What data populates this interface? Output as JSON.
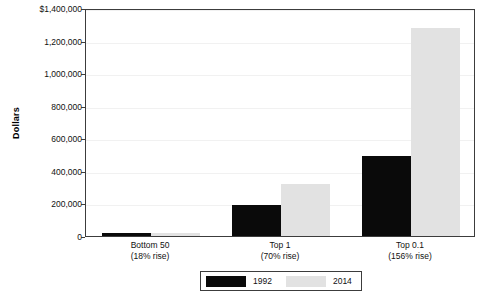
{
  "chart_data": {
    "type": "bar",
    "title": "",
    "subtitle": "",
    "xlabel": "",
    "ylabel": "Dollars",
    "categories": [
      "Bottom 50",
      "Top 1",
      "Top 0.1"
    ],
    "category_sublabels": [
      "(18% rise)",
      "(70% rise)",
      "(156% rise)"
    ],
    "series": [
      {
        "name": "1992",
        "color": "#0a0a0a",
        "values": [
          17000,
          190000,
          490000
        ]
      },
      {
        "name": "2014",
        "color": "#e2e2e2",
        "values": [
          20000,
          320000,
          1275000
        ]
      }
    ],
    "ylim": [
      0,
      1400000
    ],
    "yticks": [
      0,
      200000,
      400000,
      600000,
      800000,
      1000000,
      1200000,
      1400000
    ],
    "ytick_labels": [
      "0",
      "200,000",
      "400,000",
      "600,000",
      "800,000",
      "1,000,000",
      "1,200,000",
      "$1,400,000"
    ],
    "grid": true,
    "legend_position": "bottom-center",
    "legend_entries": [
      "1992",
      "2014"
    ]
  }
}
